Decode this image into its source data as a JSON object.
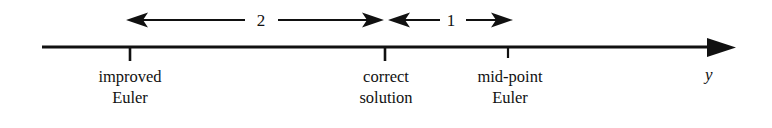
{
  "figure": {
    "axis": {
      "name": "y-axis-line",
      "label": "y",
      "arrow_direction": "right",
      "line_color": "#111111",
      "start_x": 42,
      "end_x": 735,
      "y": 47
    },
    "ticks": [
      {
        "id": "tick-improved-euler",
        "x": 130,
        "label_line_1": "improved",
        "label_line_2": "Euler"
      },
      {
        "id": "tick-correct-solution",
        "x": 385,
        "label_line_1": "correct",
        "label_line_2": "solution"
      },
      {
        "id": "tick-mid-point-euler",
        "x": 508,
        "label_line_1": "mid-point",
        "label_line_2": "Euler"
      }
    ],
    "spans": [
      {
        "id": "span-two",
        "value": "2",
        "from_x": 127,
        "to_x": 383,
        "label_x": 261,
        "y": 20,
        "arrows": "both"
      },
      {
        "id": "span-one",
        "value": "1",
        "from_x": 389,
        "to_x": 512,
        "label_x": 451,
        "y": 20,
        "arrows": "both"
      }
    ],
    "colors": {
      "ink": "#111111",
      "background": "#ffffff"
    }
  }
}
